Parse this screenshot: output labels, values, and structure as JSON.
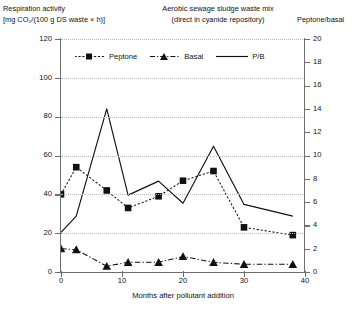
{
  "header": {
    "y_axis_title_line1": "Respiration activity",
    "y_axis_title_line2": "[mg CO₂/(100 g DS waste × h)]",
    "chart_title_line1": "Aerobic sewage sludge waste mix",
    "chart_title_line2": "(direct in cyanide repository)",
    "y2_axis_title": "Peptone/basal"
  },
  "chart_data": {
    "type": "line",
    "title": "Aerobic sewage sludge waste mix (direct in cyanide repository)",
    "xlabel": "Months after pollutant addition",
    "ylabel": "Respiration activity [mg CO₂/(100 g DS waste × h)]",
    "y2label": "Peptone/basal",
    "xlim": [
      0,
      40
    ],
    "ylim": [
      0,
      120
    ],
    "y2lim": [
      0,
      20
    ],
    "xticks": [
      0,
      10,
      20,
      30,
      40
    ],
    "yticks": [
      0,
      20,
      40,
      60,
      80,
      100,
      120
    ],
    "y2ticks": [
      0,
      2,
      4,
      6,
      8,
      10,
      12,
      14,
      16,
      18,
      20
    ],
    "grid": "horizontal-dotted",
    "legend_position": "top-inside",
    "series": [
      {
        "name": "Peptone",
        "axis": "left",
        "style": "dotted",
        "marker": "square",
        "x": [
          0,
          2.5,
          7.5,
          11,
          16,
          20,
          25,
          30,
          38
        ],
        "values": [
          40,
          54,
          42,
          33,
          39,
          47,
          52,
          23,
          19
        ]
      },
      {
        "name": "Basal",
        "axis": "left",
        "style": "dash-dot",
        "marker": "triangle",
        "x": [
          0,
          2.5,
          7.5,
          11,
          16,
          20,
          25,
          30,
          38
        ],
        "values": [
          12,
          11.5,
          3,
          5,
          5,
          8,
          5,
          4,
          4
        ]
      },
      {
        "name": "P/B",
        "axis": "right",
        "style": "solid",
        "marker": "none",
        "x": [
          0,
          2.5,
          7.5,
          11,
          16,
          20,
          25,
          30,
          38
        ],
        "values": [
          3.4,
          4.8,
          14.0,
          6.6,
          7.8,
          5.9,
          10.8,
          5.8,
          4.8
        ]
      }
    ]
  },
  "legend": [
    {
      "label": "Peptone"
    },
    {
      "label": "Basal"
    },
    {
      "label": "P/B"
    }
  ],
  "axis_labels": {
    "x_title": "Months after pollutant addition"
  }
}
